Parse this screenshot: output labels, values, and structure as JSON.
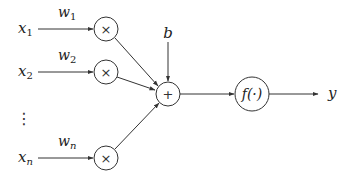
{
  "diagram": {
    "colors": {
      "stroke": "#333333",
      "text": "#222222",
      "background": "#ffffff"
    },
    "inputs": [
      {
        "label": "x",
        "sub": "1",
        "weight": "w",
        "weight_sub": "1"
      },
      {
        "label": "x",
        "sub": "2",
        "weight": "w",
        "weight_sub": "2"
      },
      {
        "label": "x",
        "sub": "n",
        "weight": "w",
        "weight_sub": "n"
      }
    ],
    "ellipsis": "⋮",
    "multiply_symbol": "×",
    "sum_symbol": "+",
    "bias_label": "b",
    "activation_label": "f(·)",
    "output_label": "y"
  }
}
